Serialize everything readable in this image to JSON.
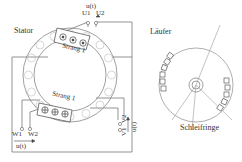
{
  "diagram": {
    "type": "electrical-machine-schematic",
    "stator": {
      "label": "Stator",
      "coil_top": {
        "label": "Strang 1",
        "conductor_symbol": "dot"
      },
      "coil_bottom": {
        "label": "Strang 1",
        "conductor_symbol": "cross"
      }
    },
    "terminals": {
      "u": {
        "label1": "U1",
        "label2": "U2",
        "voltage": "u(t)"
      },
      "v": {
        "label1": "V1",
        "label2": "V2",
        "voltage": "u(t)"
      },
      "w": {
        "label1": "W1",
        "label2": "W2",
        "voltage": "u(t)"
      }
    },
    "rotor": {
      "label": "Läufer",
      "slip_rings_label": "Schleifringe"
    },
    "colors": {
      "line": "#555555",
      "ring": "#888888",
      "text": "#333333"
    }
  }
}
